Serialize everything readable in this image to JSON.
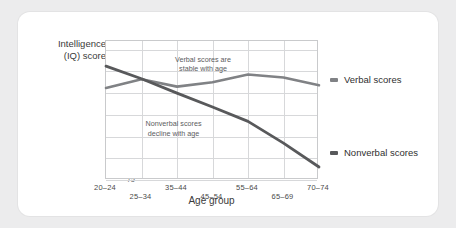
{
  "chart_data": {
    "type": "line",
    "title": "",
    "xlabel": "Age group",
    "ylabel": "Intelligence\n(IQ) score",
    "ylabel_line1": "Intelligence",
    "ylabel_line2": "(IQ) score",
    "categories": [
      "20–24",
      "25–34",
      "35–44",
      "45–54",
      "55–64",
      "65–69",
      "70–74"
    ],
    "yticks": [
      105,
      100,
      95,
      90,
      85,
      80,
      75
    ],
    "ylim": [
      75,
      107
    ],
    "grid": true,
    "legend_position": "right",
    "series": [
      {
        "name": "Verbal scores",
        "color": "#808285",
        "values": [
          96.2,
          98.2,
          96.5,
          97.5,
          99.3,
          98.6,
          96.8
        ]
      },
      {
        "name": "Nonverbal scores",
        "color": "#58595b",
        "values": [
          101.2,
          98.3,
          95.0,
          91.8,
          88.5,
          83.5,
          78.0
        ]
      }
    ],
    "annotations": [
      {
        "id": "verbal-note",
        "line1": "Verbal scores are",
        "line2": "stable with age",
        "x_pct": 46,
        "y_pct": 10
      },
      {
        "id": "nonverbal-note",
        "line1": "Nonverbal scores",
        "line2": "decline with age",
        "x_pct": 32,
        "y_pct": 57
      }
    ]
  },
  "axis": {
    "ytick_labels": [
      "105",
      "100",
      "95",
      "90",
      "85",
      "80",
      "75"
    ],
    "xtick_labels": [
      "20–24",
      "25–34",
      "35–44",
      "45–54",
      "55–64",
      "65–69",
      "70–74"
    ]
  },
  "legend": {
    "items": [
      {
        "label": "Verbal scores",
        "color": "#808285"
      },
      {
        "label": "Nonverbal scores",
        "color": "#58595b"
      }
    ]
  },
  "colors": {
    "page_background": "#ececed",
    "card_background": "#ffffff",
    "grid": "#d7d8da",
    "frame": "#c9cacc",
    "verbal": "#808285",
    "nonverbal": "#58595b",
    "text": "#3a3a3a"
  }
}
